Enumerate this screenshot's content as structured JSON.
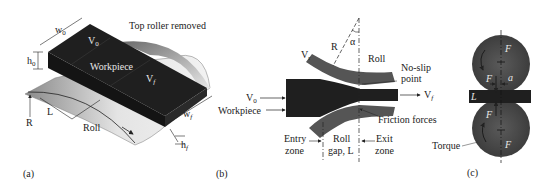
{
  "figure": {
    "panels": [
      {
        "id": "a",
        "caption": "(a)",
        "labels": {
          "top_note": "Top roller removed",
          "w0": "w",
          "w0_sub": "0",
          "h0": "h",
          "h0_sub": "0",
          "v0": "V",
          "v0_sub": "0",
          "workpiece": "Workpiece",
          "vf": "V",
          "vf_sub": "f",
          "R": "R",
          "L": "L",
          "roll": "Roll",
          "wf": "w",
          "wf_sub": "f",
          "hf": "h",
          "hf_sub": "f"
        }
      },
      {
        "id": "b",
        "caption": "(b)",
        "labels": {
          "vr": "V",
          "vr_sub": "r",
          "R": "R",
          "alpha": "α",
          "roll": "Roll",
          "no_slip_1": "No-slip",
          "no_slip_2": "point",
          "v0": "V",
          "v0_sub": "0",
          "workpiece": "Workpiece",
          "vf": "V",
          "vf_sub": "f",
          "friction": "Friction forces",
          "entry_1": "Entry",
          "entry_2": "zone",
          "gap_1": "Roll",
          "gap_2": "gap, L",
          "exit_1": "Exit",
          "exit_2": "zone"
        }
      },
      {
        "id": "c",
        "caption": "(c)",
        "labels": {
          "F_top": "F",
          "F_left_top": "F",
          "a": "a",
          "L": "L",
          "F_left_bottom": "F",
          "F_bottom": "F",
          "torque": "Torque"
        }
      }
    ],
    "colors": {
      "workpiece": "#1f1f1f",
      "roll_dark": "#555555",
      "roll_light": "#d9d9d9",
      "line": "#222222"
    }
  }
}
